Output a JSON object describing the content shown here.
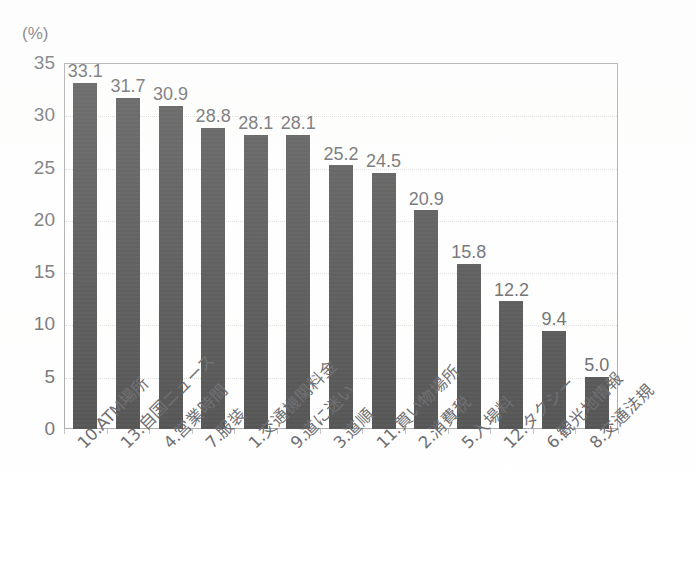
{
  "chart_data": {
    "type": "bar",
    "title": "",
    "xlabel": "",
    "ylabel": "(%)",
    "unit_label": "(%)",
    "ylim": [
      0,
      35
    ],
    "ytick_step": 5,
    "yticks": [
      "0",
      "5",
      "10",
      "15",
      "20",
      "25",
      "30",
      "35"
    ],
    "grid": true,
    "legend": "none",
    "orientation": "vertical",
    "bar_color": "#2b2b2b",
    "categories": [
      "10.ATM場所",
      "13.自国ニュース",
      "4.営業時間",
      "7.服装",
      "1.交通機関料金",
      "9.道に迷い",
      "3.道順",
      "11.買い物場所",
      "2.消費税",
      "5.入場料",
      "12.タクシー",
      "6.観光地情報",
      "8.交通法規"
    ],
    "values": [
      33.1,
      31.7,
      30.9,
      28.8,
      28.1,
      28.1,
      25.2,
      24.5,
      20.9,
      15.8,
      12.2,
      9.4,
      5.0
    ],
    "value_labels": [
      "33.1",
      "31.7",
      "30.9",
      "28.8",
      "28.1",
      "28.1",
      "25.2",
      "24.5",
      "20.9",
      "15.8",
      "12.2",
      "9.4",
      "5.0"
    ]
  }
}
